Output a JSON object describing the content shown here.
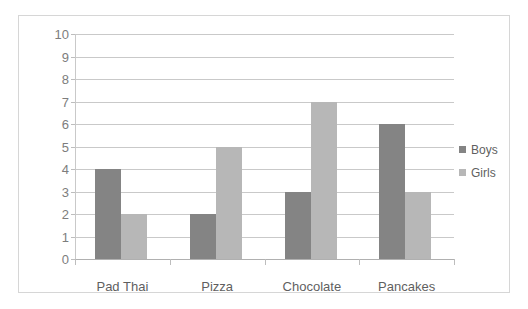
{
  "chart_data": {
    "type": "bar",
    "title": "",
    "subtitle": "",
    "xlabel": "",
    "ylabel": "",
    "categories": [
      "Pad Thai",
      "Pizza",
      "Chocolate",
      "Pancakes"
    ],
    "series": [
      {
        "name": "Boys",
        "values": [
          4,
          2,
          3,
          6
        ],
        "color": "#848484"
      },
      {
        "name": "Girls",
        "values": [
          2,
          5,
          7,
          3
        ],
        "color": "#b7b7b7"
      }
    ],
    "ylim": [
      0,
      10
    ],
    "ytick_step": 1,
    "ytick_labels": [
      "10",
      "9",
      "8",
      "7",
      "6",
      "5",
      "4",
      "3",
      "2",
      "1",
      "0"
    ],
    "grid": true,
    "grid_axis": "y",
    "legend_position": "right",
    "plot_background": "#ffffff",
    "gridline_color": "#c9c9c9",
    "axis_color": "#bdbdbd",
    "border_color": "#d6d6d6",
    "tick_label_color": "#7d7d7d",
    "category_label_color": "#5f5f5f"
  }
}
